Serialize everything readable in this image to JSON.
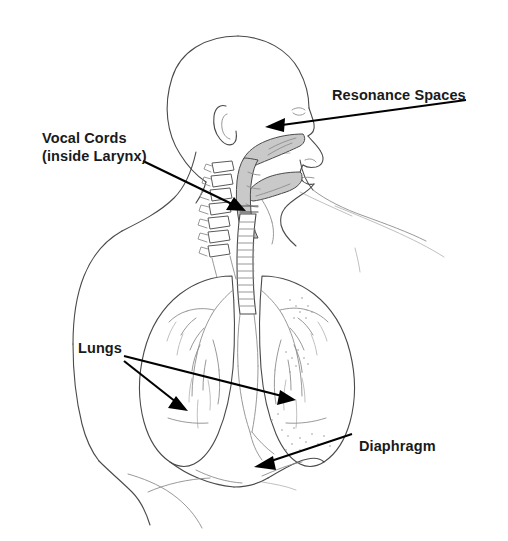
{
  "figure": {
    "background_color": "#ffffff",
    "line_color": "#4a4a4a",
    "label_color": "#1a1a1a",
    "cavity_shade_color": "#c9c9c9"
  },
  "labels": {
    "resonance": {
      "text": "Resonance Spaces",
      "target": "nasal and oral cavities"
    },
    "vocal_line1": {
      "text": "Vocal Cords"
    },
    "vocal_line2": {
      "text": "(inside Larynx)"
    },
    "lungs": {
      "text": "Lungs",
      "target": "left and right lung"
    },
    "diaphragm": {
      "text": "Diaphragm",
      "target": "diaphragm muscle below lungs"
    }
  },
  "annotations": {
    "arrow_count": 5,
    "arrows": [
      {
        "name": "resonance-arrow",
        "from": [
          466,
          100
        ],
        "to": [
          268,
          127
        ]
      },
      {
        "name": "vocal-cords-arrow",
        "from": [
          143,
          161
        ],
        "to": [
          245,
          211
        ]
      },
      {
        "name": "lungs-arrow-left",
        "from": [
          124,
          361
        ],
        "to": [
          186,
          410
        ]
      },
      {
        "name": "lungs-arrow-right",
        "from": [
          124,
          356
        ],
        "to": [
          294,
          400
        ]
      },
      {
        "name": "diaphragm-arrow",
        "from": [
          352,
          434
        ],
        "to": [
          255,
          467
        ]
      }
    ]
  },
  "structures": [
    {
      "name": "head-profile",
      "shaded": false
    },
    {
      "name": "nasal-cavity",
      "shaded": true
    },
    {
      "name": "oral-cavity",
      "shaded": true
    },
    {
      "name": "pharynx",
      "shaded": true
    },
    {
      "name": "cervical-vertebrae",
      "shaded": false
    },
    {
      "name": "trachea",
      "shaded": false
    },
    {
      "name": "left-lung",
      "shaded": false
    },
    {
      "name": "right-lung",
      "shaded": false
    },
    {
      "name": "bronchial-tree",
      "shaded": false
    },
    {
      "name": "diaphragm",
      "shaded": false
    },
    {
      "name": "torso-outline",
      "shaded": false
    },
    {
      "name": "shoulder-outline",
      "shaded": false
    }
  ]
}
